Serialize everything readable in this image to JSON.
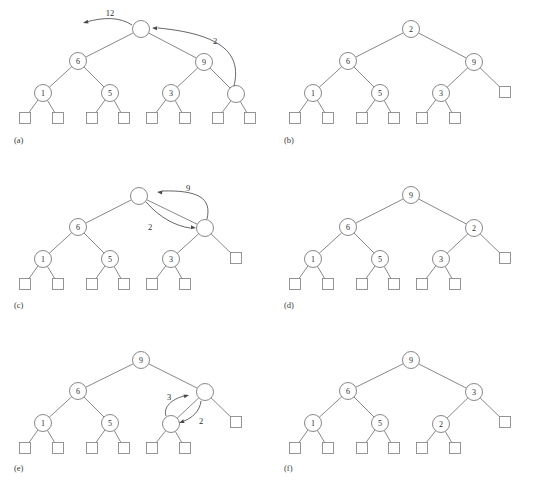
{
  "figure": {
    "panel_count": 6,
    "colors": {
      "background": "#ffffff",
      "edge": "#7b7b7b",
      "node_stroke": "#7b7b7b",
      "leaf_stroke": "#8a8a8a",
      "text": "#2e2e2e",
      "arrow": "#4a4a4a"
    },
    "geometry": {
      "node_radius": 8.5,
      "leaf_size": 11,
      "panel_width": 268,
      "panel_height": 163
    }
  },
  "panels": [
    {
      "id": "a",
      "label": "(a)",
      "label_pos": {
        "x": 14,
        "y": 140
      },
      "origin": {
        "x": 0,
        "y": 0
      },
      "nodes": [
        {
          "name": "root",
          "value": "",
          "x": 141,
          "y": 29
        },
        {
          "name": "left",
          "value": "6",
          "x": 78,
          "y": 61
        },
        {
          "name": "right",
          "value": "9",
          "x": 204,
          "y": 62
        },
        {
          "name": "left-left",
          "value": "1",
          "x": 43,
          "y": 93
        },
        {
          "name": "left-right",
          "value": "5",
          "x": 110,
          "y": 93
        },
        {
          "name": "right-left",
          "value": "3",
          "x": 171,
          "y": 93
        },
        {
          "name": "right-right",
          "value": "",
          "x": 236,
          "y": 94
        }
      ],
      "leaves": [
        {
          "name": "leaf-1",
          "x": 25,
          "y": 118
        },
        {
          "name": "leaf-2",
          "x": 58,
          "y": 118
        },
        {
          "name": "leaf-3",
          "x": 92,
          "y": 118
        },
        {
          "name": "leaf-4",
          "x": 124,
          "y": 118
        },
        {
          "name": "leaf-5",
          "x": 152,
          "y": 118
        },
        {
          "name": "leaf-6",
          "x": 185,
          "y": 118
        },
        {
          "name": "leaf-7",
          "x": 218,
          "y": 118
        },
        {
          "name": "leaf-8",
          "x": 250,
          "y": 118
        }
      ],
      "edges": [
        [
          "root",
          "left"
        ],
        [
          "root",
          "right"
        ],
        [
          "left",
          "left-left"
        ],
        [
          "left",
          "left-right"
        ],
        [
          "right",
          "right-left"
        ],
        [
          "right",
          "right-right"
        ],
        [
          "left-left",
          "leaf-1"
        ],
        [
          "left-left",
          "leaf-2"
        ],
        [
          "left-right",
          "leaf-3"
        ],
        [
          "left-right",
          "leaf-4"
        ],
        [
          "right-left",
          "leaf-5"
        ],
        [
          "right-left",
          "leaf-6"
        ],
        [
          "right-right",
          "leaf-7"
        ],
        [
          "right-right",
          "leaf-8"
        ]
      ],
      "arrows": [
        {
          "name": "arrow-out-12",
          "label": "12",
          "label_pos": {
            "x": 110,
            "y": 13
          },
          "path": "M 132 25 C 120 17 104 17 86 22",
          "head": {
            "x": 83,
            "y": 23,
            "angle": 165
          }
        },
        {
          "name": "arrow-in-2",
          "label": "2",
          "label_pos": {
            "x": 215,
            "y": 41
          },
          "path": "M 234 86 C 240 60 232 35 158 28",
          "head": {
            "x": 152,
            "y": 28,
            "angle": 183
          }
        }
      ]
    },
    {
      "id": "b",
      "label": "(b)",
      "label_pos": {
        "x": 284,
        "y": 140
      },
      "origin": {
        "x": 270,
        "y": 0
      },
      "nodes": [
        {
          "name": "root",
          "value": "2",
          "x": 411,
          "y": 29
        },
        {
          "name": "left",
          "value": "6",
          "x": 348,
          "y": 61
        },
        {
          "name": "right",
          "value": "9",
          "x": 474,
          "y": 62
        },
        {
          "name": "left-left",
          "value": "1",
          "x": 313,
          "y": 93
        },
        {
          "name": "left-right",
          "value": "5",
          "x": 380,
          "y": 93
        },
        {
          "name": "right-left",
          "value": "3",
          "x": 441,
          "y": 93
        }
      ],
      "leaves": [
        {
          "name": "leaf-1",
          "x": 295,
          "y": 118
        },
        {
          "name": "leaf-2",
          "x": 328,
          "y": 118
        },
        {
          "name": "leaf-3",
          "x": 362,
          "y": 118
        },
        {
          "name": "leaf-4",
          "x": 394,
          "y": 118
        },
        {
          "name": "leaf-5",
          "x": 422,
          "y": 118
        },
        {
          "name": "leaf-6",
          "x": 455,
          "y": 118
        },
        {
          "name": "leaf-right",
          "x": 505,
          "y": 92
        }
      ],
      "edges": [
        [
          "root",
          "left"
        ],
        [
          "root",
          "right"
        ],
        [
          "left",
          "left-left"
        ],
        [
          "left",
          "left-right"
        ],
        [
          "right",
          "right-left"
        ],
        [
          "right",
          "leaf-right"
        ],
        [
          "left-left",
          "leaf-1"
        ],
        [
          "left-left",
          "leaf-2"
        ],
        [
          "left-right",
          "leaf-3"
        ],
        [
          "left-right",
          "leaf-4"
        ],
        [
          "right-left",
          "leaf-5"
        ],
        [
          "right-left",
          "leaf-6"
        ]
      ],
      "arrows": []
    },
    {
      "id": "c",
      "label": "(c)",
      "label_pos": {
        "x": 14,
        "y": 305
      },
      "origin": {
        "x": 0,
        "y": 165
      },
      "nodes": [
        {
          "name": "root",
          "value": "",
          "x": 139,
          "y": 196
        },
        {
          "name": "left",
          "value": "6",
          "x": 78,
          "y": 227
        },
        {
          "name": "right",
          "value": "",
          "x": 205,
          "y": 228
        },
        {
          "name": "left-left",
          "value": "1",
          "x": 43,
          "y": 259
        },
        {
          "name": "left-right",
          "value": "5",
          "x": 110,
          "y": 259
        },
        {
          "name": "right-left",
          "value": "3",
          "x": 171,
          "y": 259
        }
      ],
      "leaves": [
        {
          "name": "leaf-1",
          "x": 25,
          "y": 284
        },
        {
          "name": "leaf-2",
          "x": 58,
          "y": 284
        },
        {
          "name": "leaf-3",
          "x": 92,
          "y": 284
        },
        {
          "name": "leaf-4",
          "x": 124,
          "y": 284
        },
        {
          "name": "leaf-5",
          "x": 152,
          "y": 284
        },
        {
          "name": "leaf-6",
          "x": 185,
          "y": 284
        },
        {
          "name": "leaf-right",
          "x": 236,
          "y": 258
        }
      ],
      "edges": [
        [
          "root",
          "left"
        ],
        [
          "root",
          "right"
        ],
        [
          "left",
          "left-left"
        ],
        [
          "left",
          "left-right"
        ],
        [
          "right",
          "right-left"
        ],
        [
          "right",
          "leaf-right"
        ],
        [
          "left-left",
          "leaf-1"
        ],
        [
          "left-left",
          "leaf-2"
        ],
        [
          "left-right",
          "leaf-3"
        ],
        [
          "left-right",
          "leaf-4"
        ],
        [
          "right-left",
          "leaf-5"
        ],
        [
          "right-left",
          "leaf-6"
        ]
      ],
      "arrows": [
        {
          "name": "arrow-up-9",
          "label": "9",
          "label_pos": {
            "x": 188,
            "y": 188
          },
          "path": "M 207 219 C 212 198 198 190 162 191",
          "head": {
            "x": 157,
            "y": 192,
            "angle": 186
          }
        },
        {
          "name": "arrow-down-2",
          "label": "2",
          "label_pos": {
            "x": 150,
            "y": 227
          },
          "path": "M 146 202 C 160 218 176 226 190 228",
          "head": {
            "x": 196,
            "y": 228,
            "angle": 8
          }
        }
      ]
    },
    {
      "id": "d",
      "label": "(d)",
      "label_pos": {
        "x": 284,
        "y": 305
      },
      "origin": {
        "x": 270,
        "y": 165
      },
      "nodes": [
        {
          "name": "root",
          "value": "9",
          "x": 411,
          "y": 195
        },
        {
          "name": "left",
          "value": "6",
          "x": 348,
          "y": 227
        },
        {
          "name": "right",
          "value": "2",
          "x": 474,
          "y": 228
        },
        {
          "name": "left-left",
          "value": "1",
          "x": 313,
          "y": 259
        },
        {
          "name": "left-right",
          "value": "5",
          "x": 380,
          "y": 259
        },
        {
          "name": "right-left",
          "value": "3",
          "x": 441,
          "y": 259
        }
      ],
      "leaves": [
        {
          "name": "leaf-1",
          "x": 295,
          "y": 284
        },
        {
          "name": "leaf-2",
          "x": 328,
          "y": 284
        },
        {
          "name": "leaf-3",
          "x": 362,
          "y": 284
        },
        {
          "name": "leaf-4",
          "x": 394,
          "y": 284
        },
        {
          "name": "leaf-5",
          "x": 422,
          "y": 284
        },
        {
          "name": "leaf-6",
          "x": 455,
          "y": 284
        },
        {
          "name": "leaf-right",
          "x": 505,
          "y": 258
        }
      ],
      "edges": [
        [
          "root",
          "left"
        ],
        [
          "root",
          "right"
        ],
        [
          "left",
          "left-left"
        ],
        [
          "left",
          "left-right"
        ],
        [
          "right",
          "right-left"
        ],
        [
          "right",
          "leaf-right"
        ],
        [
          "left-left",
          "leaf-1"
        ],
        [
          "left-left",
          "leaf-2"
        ],
        [
          "left-right",
          "leaf-3"
        ],
        [
          "left-right",
          "leaf-4"
        ],
        [
          "right-left",
          "leaf-5"
        ],
        [
          "right-left",
          "leaf-6"
        ]
      ],
      "arrows": []
    },
    {
      "id": "e",
      "label": "(e)",
      "label_pos": {
        "x": 14,
        "y": 468
      },
      "origin": {
        "x": 0,
        "y": 330
      },
      "nodes": [
        {
          "name": "root",
          "value": "9",
          "x": 141,
          "y": 360
        },
        {
          "name": "left",
          "value": "6",
          "x": 78,
          "y": 391
        },
        {
          "name": "right",
          "value": "",
          "x": 205,
          "y": 392
        },
        {
          "name": "left-left",
          "value": "1",
          "x": 43,
          "y": 423
        },
        {
          "name": "left-right",
          "value": "5",
          "x": 110,
          "y": 423
        },
        {
          "name": "right-left",
          "value": "",
          "x": 171,
          "y": 424
        }
      ],
      "leaves": [
        {
          "name": "leaf-1",
          "x": 25,
          "y": 448
        },
        {
          "name": "leaf-2",
          "x": 58,
          "y": 448
        },
        {
          "name": "leaf-3",
          "x": 92,
          "y": 448
        },
        {
          "name": "leaf-4",
          "x": 124,
          "y": 448
        },
        {
          "name": "leaf-5",
          "x": 152,
          "y": 448
        },
        {
          "name": "leaf-6",
          "x": 185,
          "y": 448
        },
        {
          "name": "leaf-right",
          "x": 236,
          "y": 422
        }
      ],
      "edges": [
        [
          "root",
          "left"
        ],
        [
          "root",
          "right"
        ],
        [
          "left",
          "left-left"
        ],
        [
          "left",
          "left-right"
        ],
        [
          "right",
          "right-left"
        ],
        [
          "right",
          "leaf-right"
        ],
        [
          "left-left",
          "leaf-1"
        ],
        [
          "left-left",
          "leaf-2"
        ],
        [
          "left-right",
          "leaf-3"
        ],
        [
          "left-right",
          "leaf-4"
        ],
        [
          "right-left",
          "leaf-5"
        ],
        [
          "right-left",
          "leaf-6"
        ]
      ],
      "arrows": [
        {
          "name": "arrow-up-3",
          "label": "3",
          "label_pos": {
            "x": 169,
            "y": 397
          },
          "path": "M 166 416 C 163 407 172 399 184 396",
          "head": {
            "x": 189,
            "y": 395,
            "angle": -16
          }
        },
        {
          "name": "arrow-down-2",
          "label": "2",
          "label_pos": {
            "x": 201,
            "y": 421
          },
          "path": "M 201 401 C 200 411 192 418 184 421",
          "head": {
            "x": 179,
            "y": 423,
            "angle": 160
          }
        }
      ]
    },
    {
      "id": "f",
      "label": "(f)",
      "label_pos": {
        "x": 284,
        "y": 468
      },
      "origin": {
        "x": 270,
        "y": 330
      },
      "nodes": [
        {
          "name": "root",
          "value": "9",
          "x": 411,
          "y": 360
        },
        {
          "name": "left",
          "value": "6",
          "x": 348,
          "y": 391
        },
        {
          "name": "right",
          "value": "3",
          "x": 474,
          "y": 392
        },
        {
          "name": "left-left",
          "value": "1",
          "x": 313,
          "y": 423
        },
        {
          "name": "left-right",
          "value": "5",
          "x": 380,
          "y": 423
        },
        {
          "name": "right-left",
          "value": "2",
          "x": 441,
          "y": 424
        }
      ],
      "leaves": [
        {
          "name": "leaf-1",
          "x": 295,
          "y": 448
        },
        {
          "name": "leaf-2",
          "x": 328,
          "y": 448
        },
        {
          "name": "leaf-3",
          "x": 362,
          "y": 448
        },
        {
          "name": "leaf-4",
          "x": 394,
          "y": 448
        },
        {
          "name": "leaf-5",
          "x": 422,
          "y": 448
        },
        {
          "name": "leaf-6",
          "x": 455,
          "y": 448
        },
        {
          "name": "leaf-right",
          "x": 505,
          "y": 422
        }
      ],
      "edges": [
        [
          "root",
          "left"
        ],
        [
          "root",
          "right"
        ],
        [
          "left",
          "left-left"
        ],
        [
          "left",
          "left-right"
        ],
        [
          "right",
          "right-left"
        ],
        [
          "right",
          "leaf-right"
        ],
        [
          "left-left",
          "leaf-1"
        ],
        [
          "left-left",
          "leaf-2"
        ],
        [
          "left-right",
          "leaf-3"
        ],
        [
          "left-right",
          "leaf-4"
        ],
        [
          "right-left",
          "leaf-5"
        ],
        [
          "right-left",
          "leaf-6"
        ]
      ],
      "arrows": []
    }
  ]
}
